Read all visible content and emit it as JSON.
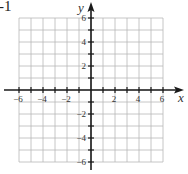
{
  "corner_label": "-1",
  "chart_data": {
    "type": "scatter",
    "title": "",
    "xlabel": "x",
    "ylabel": "y",
    "xlim": [
      -6,
      6
    ],
    "ylim": [
      -6,
      6
    ],
    "grid": true,
    "grid_step": 1,
    "x_ticks": [
      -6,
      -4,
      -2,
      2,
      4,
      6
    ],
    "y_ticks": [
      6,
      4,
      2,
      -2,
      -4,
      -6
    ],
    "x_tick_labels": [
      "-6",
      "-4",
      "-2",
      "2",
      "4",
      "6"
    ],
    "y_tick_labels": [
      "6",
      "4",
      "2",
      "-2",
      "-4",
      "-6"
    ],
    "series": [],
    "legend": null
  },
  "colors": {
    "grid": "#b8b8b8",
    "axis": "#1a1a1a",
    "label": "#333333"
  }
}
